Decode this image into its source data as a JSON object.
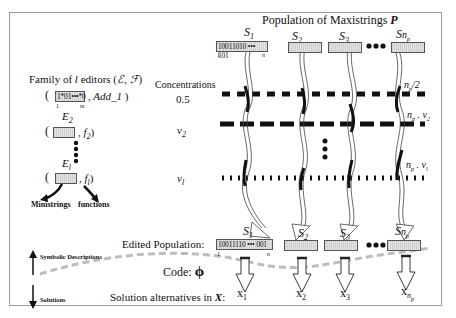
{
  "title": "Population of Maxistrings",
  "title_symbol": "P",
  "population": {
    "strings": [
      {
        "label": "S",
        "sub": "1",
        "bits": "10011010 ••• 101",
        "start_index": "1",
        "end_index": "n"
      },
      {
        "label": "S",
        "sub": "2"
      },
      {
        "label": "S",
        "sub": "3"
      },
      {
        "label": "S",
        "sub": "n",
        "subsub": "p"
      }
    ],
    "ellipsis": "●●●"
  },
  "editors": {
    "heading": "Family of",
    "heading_var": "l",
    "heading_rest": "editors (",
    "heading_sets": "ℰ, ℱ",
    "heading_close": ")",
    "items": [
      {
        "ministring": "1*01•••*0",
        "start_index": "1",
        "end_index": "m",
        "function": "Add_1"
      },
      {
        "editor": "E",
        "editor_sub": "2",
        "function": "f",
        "function_sub": "2"
      },
      {
        "editor": "E",
        "editor_sub": "l",
        "function": "f",
        "function_sub": "l"
      }
    ],
    "ministrings_label": "Ministrings",
    "functions_label": "functions"
  },
  "concentrations": {
    "heading": "Concentrations",
    "rows": [
      {
        "value": "0.5",
        "count": "n",
        "count_sub": "p",
        "count_rest": "/2"
      },
      {
        "value": "v",
        "value_sub": "2",
        "count": "n",
        "count_sub": "p",
        "count_rest": " . v",
        "count_rest_sub": "2"
      },
      {
        "value": "v",
        "value_sub": "l",
        "count": "n",
        "count_sub": "p",
        "count_rest": " . v",
        "count_rest_sub": "l"
      }
    ]
  },
  "edited_population": {
    "label": "Edited Population:",
    "strings": [
      {
        "label": "S",
        "sub": "1",
        "bits": "10011110 ••• 001",
        "start_index": "1",
        "end_index": "n"
      },
      {
        "label": "S",
        "sub": "2"
      },
      {
        "label": "S",
        "sub": "3"
      },
      {
        "label": "S",
        "sub": "n",
        "subsub": "p"
      }
    ]
  },
  "code": {
    "label": "Code:",
    "symbol": "ϕ"
  },
  "solutions": {
    "label": "Solution alternatives in",
    "space": "X",
    "colon": ":",
    "items": [
      {
        "x": "x",
        "sub": "1"
      },
      {
        "x": "x",
        "sub": "2"
      },
      {
        "x": "x",
        "sub": "3"
      },
      {
        "x": "x",
        "sub": "n",
        "subsub": "p"
      }
    ]
  },
  "legend": {
    "top": "Symbolic Descriptions",
    "bottom": "Solutions"
  }
}
